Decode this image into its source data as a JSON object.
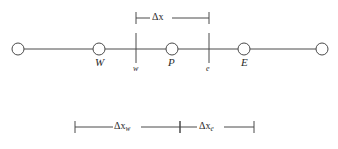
{
  "figure": {
    "kind": "control-volume-grid-schematic",
    "background_color": "#ffffff",
    "line_color": "#4a4a4a",
    "text_color": "#2a2a2a"
  },
  "grid_line": {
    "y": 49,
    "x_start": 18,
    "x_end": 322
  },
  "nodes": [
    {
      "id": "node-far-west",
      "label": "",
      "cx": 18,
      "cy": 49,
      "r": 6
    },
    {
      "id": "node-W",
      "label": "W",
      "cx": 99,
      "cy": 49,
      "r": 6
    },
    {
      "id": "node-P",
      "label": "P",
      "cx": 172,
      "cy": 49,
      "r": 6
    },
    {
      "id": "node-E",
      "label": "E",
      "cx": 244,
      "cy": 49,
      "r": 6
    },
    {
      "id": "node-far-east",
      "label": "",
      "cx": 322,
      "cy": 49,
      "r": 6
    }
  ],
  "node_labels": [
    {
      "text": "W",
      "x": 95,
      "y": 62
    },
    {
      "text": "P",
      "x": 168,
      "y": 62
    },
    {
      "text": "E",
      "x": 241,
      "y": 62
    }
  ],
  "faces": [
    {
      "id": "face-w",
      "label": "w",
      "x": 136,
      "y_top": 33,
      "y_bottom": 63,
      "label_x": 133,
      "label_y": 66
    },
    {
      "id": "face-e",
      "label": "e",
      "x": 209,
      "y_top": 33,
      "y_bottom": 63,
      "label_x": 206,
      "label_y": 66
    }
  ],
  "dimensions": [
    {
      "id": "dim-delta-x",
      "symbol": "Δx",
      "base": "Δx",
      "subscript": "",
      "y": 18,
      "x_left": 136,
      "x_right": 209,
      "tick_half_height": 6,
      "label_x": 160,
      "label_y": 11
    },
    {
      "id": "dim-delta-x-w",
      "symbol": "Δx_w",
      "base": "Δx",
      "subscript": "w",
      "y": 127,
      "x_left": 75,
      "x_right": 180,
      "tick_half_height": 6,
      "label_x": 116,
      "label_y": 120
    },
    {
      "id": "dim-delta-x-e",
      "symbol": "Δx_e",
      "base": "Δx",
      "subscript": "e",
      "y": 127,
      "x_left": 180,
      "x_right": 254,
      "tick_half_height": 6,
      "label_x": 200,
      "label_y": 120
    }
  ]
}
